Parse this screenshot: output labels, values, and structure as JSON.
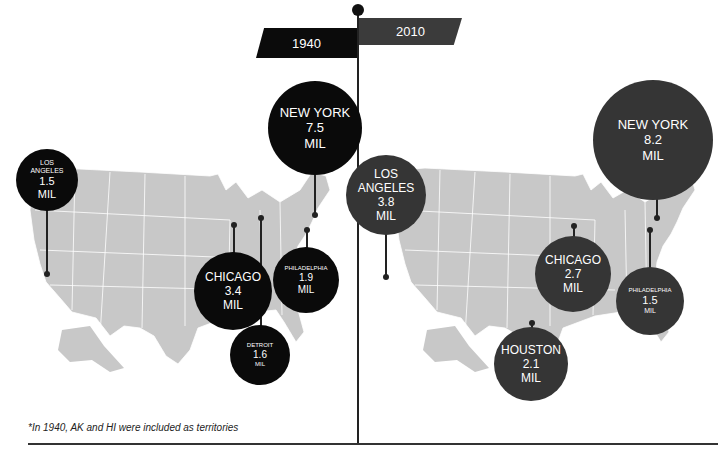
{
  "header": {
    "left_year": "1940",
    "right_year": "2010"
  },
  "colors": {
    "bubble_1940": "#0a0a0a",
    "bubble_2010": "#353535",
    "map_fill": "#c8c8c8",
    "map_borders": "#ffffff"
  },
  "panels": {
    "y1940": {
      "cities": [
        {
          "name_lines": [
            "NEW YORK"
          ],
          "value": "7.5",
          "unit": "MIL"
        },
        {
          "name_lines": [
            "LOS",
            "ANGELES"
          ],
          "value": "1.5",
          "unit": "MIL"
        },
        {
          "name_lines": [
            "CHICAGO"
          ],
          "value": "3.4",
          "unit": "MIL"
        },
        {
          "name_lines": [
            "PHILADELPHIA"
          ],
          "value": "1.9",
          "unit": "MIL"
        },
        {
          "name_lines": [
            "DETROIT"
          ],
          "value": "1.6",
          "unit": "MIL"
        }
      ]
    },
    "y2010": {
      "cities": [
        {
          "name_lines": [
            "NEW YORK"
          ],
          "value": "8.2",
          "unit": "MIL"
        },
        {
          "name_lines": [
            "LOS",
            "ANGELES"
          ],
          "value": "3.8",
          "unit": "MIL"
        },
        {
          "name_lines": [
            "CHICAGO"
          ],
          "value": "2.7",
          "unit": "MIL"
        },
        {
          "name_lines": [
            "PHILADELPHIA"
          ],
          "value": "1.5",
          "unit": "MIL"
        },
        {
          "name_lines": [
            "HOUSTON"
          ],
          "value": "2.1",
          "unit": "MIL"
        }
      ]
    }
  },
  "footnote": "*In 1940, AK and HI were included as territories"
}
